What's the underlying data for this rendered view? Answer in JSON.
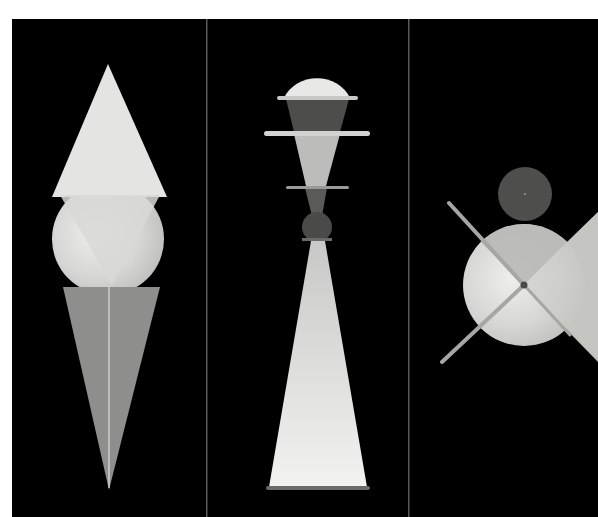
{
  "image": {
    "description": "Three black panels with geometric figurine compositions made of triangles, circles, cones and rods",
    "background_color": "#000000",
    "margin_color": "#ffffff",
    "panels": [
      {
        "name": "panel-1",
        "figure": "cone-circle-cone figure"
      },
      {
        "name": "panel-2",
        "figure": "dome-and-rings spindle figure"
      },
      {
        "name": "panel-3",
        "figure": "circles with crossed rods figure"
      }
    ],
    "colors": {
      "light": "#e6e6e4",
      "light_gray": "#cfcfcd",
      "mid_gray": "#8c8c8a",
      "dark_gray": "#4a4a48",
      "divider": "#5a5a5a"
    }
  }
}
